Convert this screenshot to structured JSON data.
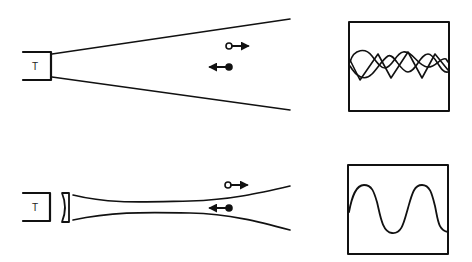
{
  "figure": {
    "panels": [
      {
        "id": "diverging-beam",
        "transducer_label": "T",
        "beam": "diverging",
        "has_lens": false,
        "particles": [
          {
            "marker": "open-circle",
            "direction": "right"
          },
          {
            "marker": "filled-circle",
            "direction": "left"
          }
        ],
        "signal": "two superimposed opposite-phase waveforms (interference pattern)"
      },
      {
        "id": "focused-beam",
        "transducer_label": "T",
        "beam": "focused",
        "has_lens": true,
        "particles": [
          {
            "marker": "open-circle",
            "direction": "right"
          },
          {
            "marker": "filled-circle",
            "direction": "left"
          }
        ],
        "signal": "single clean periodic waveform"
      }
    ]
  },
  "colors": {
    "ink": "#111111",
    "background": "#ffffff"
  }
}
